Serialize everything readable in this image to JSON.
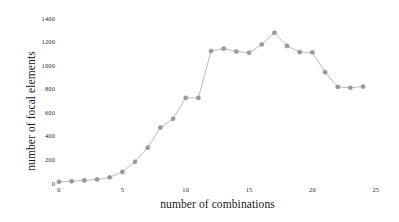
{
  "chart_data": {
    "type": "line",
    "title": "",
    "xlabel": "number of combinations",
    "ylabel": "number of focal elements",
    "xlim": [
      -0.8,
      25.8
    ],
    "ylim": [
      0,
      1450
    ],
    "xticks": [
      0,
      5,
      10,
      15,
      20,
      25
    ],
    "yticks": [
      0,
      200,
      400,
      600,
      800,
      1000,
      1200,
      1400
    ],
    "xtick_labels": [
      "0",
      "5",
      "10",
      "15",
      "20",
      "25"
    ],
    "ytick_labels": [
      "0",
      "200",
      "400",
      "600",
      "800",
      "1000",
      "1200",
      "1400"
    ],
    "grid": false,
    "legend": null,
    "marker": "circle",
    "marker_color": "#9a9a9a",
    "line_color": "#b3b3b3",
    "background": "#ffffff",
    "x": [
      0,
      1,
      2,
      3,
      4,
      5,
      6,
      7,
      8,
      9,
      10,
      11,
      12,
      13,
      14,
      15,
      16,
      17,
      18,
      19,
      20,
      21,
      22,
      23,
      24
    ],
    "values": [
      10,
      15,
      22,
      30,
      48,
      95,
      180,
      300,
      470,
      545,
      722,
      722,
      1120,
      1140,
      1115,
      1105,
      1175,
      1275,
      1163,
      1110,
      1108,
      940,
      815,
      808,
      818
    ],
    "series": [
      {
        "name": "focal elements",
        "values": [
          10,
          15,
          22,
          30,
          48,
          95,
          180,
          300,
          470,
          545,
          722,
          722,
          1120,
          1140,
          1115,
          1105,
          1175,
          1275,
          1163,
          1110,
          1108,
          940,
          815,
          808,
          818
        ]
      }
    ]
  }
}
